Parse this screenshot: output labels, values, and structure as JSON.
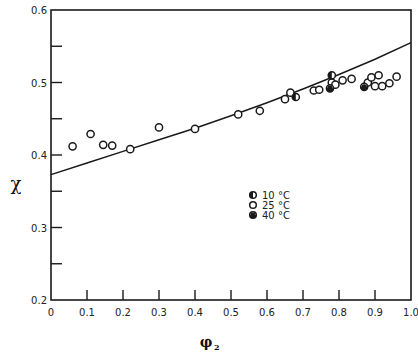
{
  "chart_data": {
    "type": "scatter",
    "title": "",
    "xlabel": "φ₂",
    "ylabel": "χ",
    "xlim": [
      0,
      1.0
    ],
    "ylim": [
      0.2,
      0.6
    ],
    "grid": false,
    "legend_position": "center-right inside plot",
    "x_ticks": [
      "0",
      "0.1",
      "0.2",
      "0.3",
      "0.4",
      "0.5",
      "0.6",
      "0.7",
      "0.8",
      "0.9",
      "1.0"
    ],
    "y_ticks_labeled": [
      "0.2",
      "0.3",
      "0.4",
      "0.5",
      "0.6"
    ],
    "y_minor_ticks": [
      0.25,
      0.35,
      0.45,
      0.55
    ],
    "series": [
      {
        "name": "10 °C",
        "marker": "half-filled circle",
        "points": [
          [
            0.78,
            0.51
          ],
          [
            0.68,
            0.48
          ]
        ]
      },
      {
        "name": "25 °C",
        "marker": "open circle",
        "points": [
          [
            0.06,
            0.412
          ],
          [
            0.11,
            0.429
          ],
          [
            0.145,
            0.414
          ],
          [
            0.17,
            0.413
          ],
          [
            0.22,
            0.408
          ],
          [
            0.3,
            0.438
          ],
          [
            0.4,
            0.436
          ],
          [
            0.52,
            0.456
          ],
          [
            0.58,
            0.461
          ],
          [
            0.65,
            0.477
          ],
          [
            0.665,
            0.486
          ],
          [
            0.73,
            0.489
          ],
          [
            0.745,
            0.49
          ],
          [
            0.78,
            0.5
          ],
          [
            0.79,
            0.497
          ],
          [
            0.81,
            0.503
          ],
          [
            0.835,
            0.505
          ],
          [
            0.88,
            0.5
          ],
          [
            0.89,
            0.507
          ],
          [
            0.9,
            0.495
          ],
          [
            0.91,
            0.51
          ],
          [
            0.92,
            0.495
          ],
          [
            0.94,
            0.499
          ],
          [
            0.96,
            0.508
          ]
        ]
      },
      {
        "name": "40 °C",
        "marker": "bottom-filled circle",
        "points": [
          [
            0.775,
            0.492
          ],
          [
            0.87,
            0.494
          ]
        ]
      }
    ],
    "fit_curve": {
      "description": "smooth theoretical curve",
      "points": [
        [
          0,
          0.373
        ],
        [
          0.1,
          0.389
        ],
        [
          0.2,
          0.405
        ],
        [
          0.3,
          0.421
        ],
        [
          0.4,
          0.437
        ],
        [
          0.5,
          0.454
        ],
        [
          0.6,
          0.472
        ],
        [
          0.7,
          0.491
        ],
        [
          0.8,
          0.511
        ],
        [
          0.9,
          0.532
        ],
        [
          1.0,
          0.555
        ]
      ]
    }
  },
  "legend": {
    "items": [
      {
        "label": "10 °C",
        "marker": "half-filled"
      },
      {
        "label": "25 °C",
        "marker": "open"
      },
      {
        "label": "40 °C",
        "marker": "bottom-filled"
      }
    ]
  },
  "axes": {
    "xlabel_main": "φ",
    "xlabel_sub": "2",
    "ylabel": "χ"
  }
}
